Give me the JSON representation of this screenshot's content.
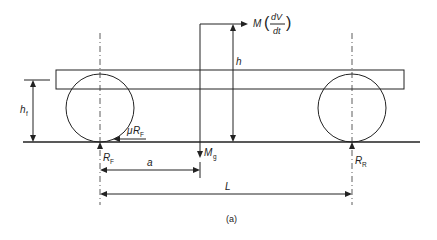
{
  "diagram": {
    "caption": "(a)",
    "labels": {
      "inertia_force": {
        "M": "M",
        "frac_num": "dV",
        "frac_den": "dt",
        "open_paren": "(",
        "close_paren": ")"
      },
      "cg_height": "h",
      "front_axle_height": {
        "main": "h",
        "sub": "f"
      },
      "friction_force": {
        "mu": "μ",
        "main": "R",
        "sub": "F"
      },
      "front_reaction": {
        "main": "R",
        "sub": "F"
      },
      "rear_reaction": {
        "main": "R",
        "sub": "R"
      },
      "weight": {
        "main": "M",
        "sub": "g"
      },
      "cg_distance": "a",
      "wheelbase": "L"
    }
  }
}
